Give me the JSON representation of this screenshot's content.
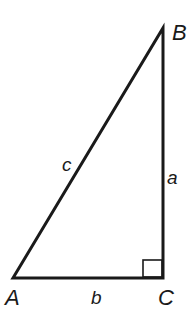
{
  "diagram": {
    "type": "right-triangle",
    "vertices": {
      "A": {
        "label": "A",
        "x": 13,
        "y": 278
      },
      "B": {
        "label": "B",
        "x": 163,
        "y": 28
      },
      "C": {
        "label": "C",
        "x": 163,
        "y": 278
      }
    },
    "sides": {
      "a": {
        "label": "a",
        "between": [
          "B",
          "C"
        ]
      },
      "b": {
        "label": "b",
        "between": [
          "A",
          "C"
        ]
      },
      "c": {
        "label": "c",
        "between": [
          "A",
          "B"
        ]
      }
    },
    "right_angle_at": "C",
    "colors": {
      "stroke": "#1a1a1a",
      "background": "#ffffff"
    }
  }
}
